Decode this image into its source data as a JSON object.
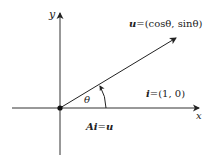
{
  "diagram": {
    "axes": {
      "x_label": "x",
      "y_label": "y"
    },
    "vector_u": {
      "name": "u",
      "equals": "=",
      "value": "(cosθ, sinθ)"
    },
    "angle": {
      "symbol": "θ"
    },
    "unit_vector_i": {
      "name": "i",
      "equals": "=",
      "value": "(1, 0)"
    },
    "equation": {
      "lhs_A": "A",
      "lhs_i": "i",
      "equals": "=",
      "rhs": "u"
    },
    "colors": {
      "stroke": "#222222",
      "axis": "#333333",
      "background": "#ffffff"
    }
  }
}
